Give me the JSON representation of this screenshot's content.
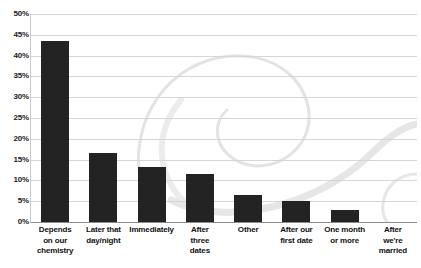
{
  "chart_data": {
    "type": "bar",
    "title": "",
    "xlabel": "",
    "ylabel": "",
    "ylim": [
      0,
      50
    ],
    "ytick_step": 5,
    "grid": true,
    "legend": "none",
    "value_suffix": "%",
    "categories": [
      "Depends on our chemistry",
      "Later that day/night",
      "Immediately",
      "After three dates",
      "Other",
      "After our first date",
      "One month or more",
      "After we're married"
    ],
    "category_lines": [
      [
        "Depends",
        "on our",
        "chemistry"
      ],
      [
        "Later that",
        "day/night"
      ],
      [
        "Immediately"
      ],
      [
        "After",
        "three",
        "dates"
      ],
      [
        "Other"
      ],
      [
        "After our",
        "first date"
      ],
      [
        "One month",
        "or more"
      ],
      [
        "After",
        "we're",
        "married"
      ]
    ],
    "values": [
      43.5,
      16.7,
      13.3,
      11.5,
      6.5,
      5.0,
      2.8,
      0
    ],
    "ytick_labels": [
      "50%",
      "45%",
      "40%",
      "35%",
      "30%",
      "25%",
      "20%",
      "15%",
      "10%",
      "5%",
      "0%"
    ],
    "ytick_values": [
      50,
      45,
      40,
      35,
      30,
      25,
      20,
      15,
      10,
      5,
      0
    ]
  },
  "style": {
    "bar_color": "#232323",
    "grid_color": "#d6d6d6",
    "axis_color": "#8c8c8c",
    "text_color": "#111111",
    "background": "#ffffff",
    "watermark_color": "#e4e4e4"
  }
}
